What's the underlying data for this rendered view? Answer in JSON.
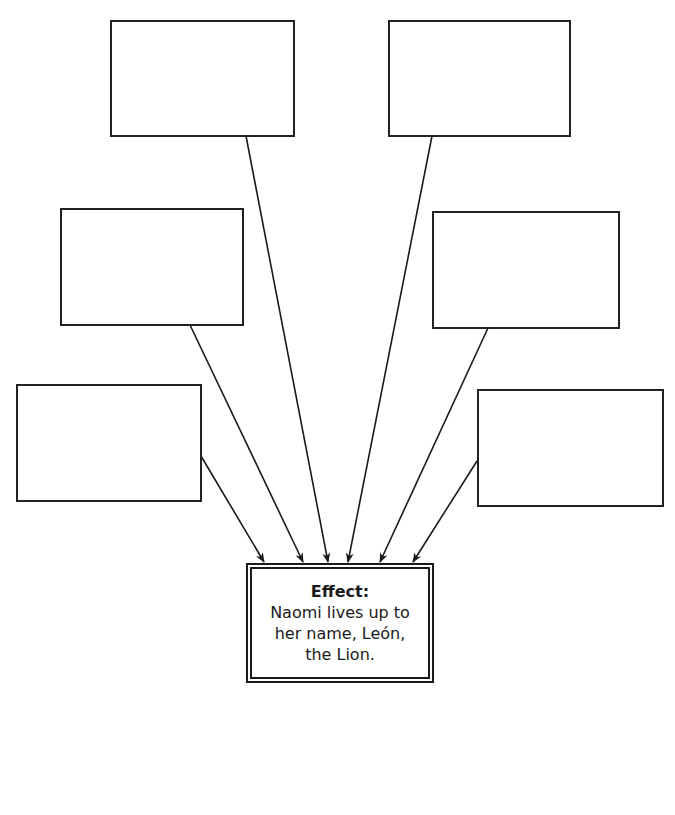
{
  "diagram": {
    "type": "cause-and-effect",
    "cause_boxes": [
      {
        "id": "cause-top-left",
        "text": "",
        "x": 110,
        "y": 20,
        "w": 185,
        "h": 117
      },
      {
        "id": "cause-top-right",
        "text": "",
        "x": 388,
        "y": 20,
        "w": 183,
        "h": 117
      },
      {
        "id": "cause-mid-left",
        "text": "",
        "x": 60,
        "y": 208,
        "w": 184,
        "h": 118
      },
      {
        "id": "cause-mid-right",
        "text": "",
        "x": 432,
        "y": 211,
        "w": 188,
        "h": 118
      },
      {
        "id": "cause-bottom-left",
        "text": "",
        "x": 16,
        "y": 384,
        "w": 186,
        "h": 118
      },
      {
        "id": "cause-bottom-right",
        "text": "",
        "x": 477,
        "y": 389,
        "w": 187,
        "h": 118
      }
    ],
    "effect": {
      "title": "Effect:",
      "line1": "Naomi lives up to",
      "line2": "her name, León,",
      "line3": "the Lion."
    }
  }
}
